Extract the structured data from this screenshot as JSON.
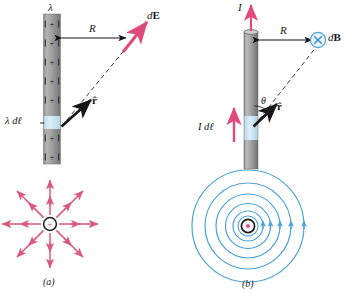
{
  "figure": {
    "colors": {
      "pink_vector": "#e04a7b",
      "pink_field_line": "#d9587f",
      "blue_field_line": "#4aa3d9",
      "blue_symbol": "#3b8fd4",
      "blue_highlight": "#c8e4f3",
      "rod_gray": "#9a9a9a",
      "rod_dark": "#6f6f6f",
      "black": "#16161a"
    },
    "panels": [
      {
        "id": "a",
        "caption": "(a)",
        "kind": "electric",
        "rod": {
          "charge_symbol": "+",
          "charge_count": 8,
          "type": "charged-rod",
          "orientation": "vertical"
        },
        "labels": {
          "lambda": "λ",
          "distance": "R",
          "field_vector": "d",
          "field_vector_bold": "E",
          "source_element": "λ d",
          "source_element_bold": "ℓ",
          "unit_vector": "r̂"
        },
        "starburst": {
          "center_symbol": "+",
          "ray_count": 8,
          "direction": "outward"
        }
      },
      {
        "id": "b",
        "caption": "(b)",
        "kind": "magnetic",
        "rod": {
          "type": "current-carrying-wire",
          "orientation": "vertical"
        },
        "labels": {
          "current": "I",
          "distance": "R",
          "field_vector": "d",
          "field_vector_bold": "B",
          "field_symbol": "×",
          "source_element": "I d",
          "source_element_bold": "ℓ",
          "unit_vector": "r̂",
          "angle": "θ"
        },
        "field_circles": {
          "center_symbol": "•",
          "circle_count": 7,
          "direction": "counterclockwise"
        }
      }
    ]
  }
}
